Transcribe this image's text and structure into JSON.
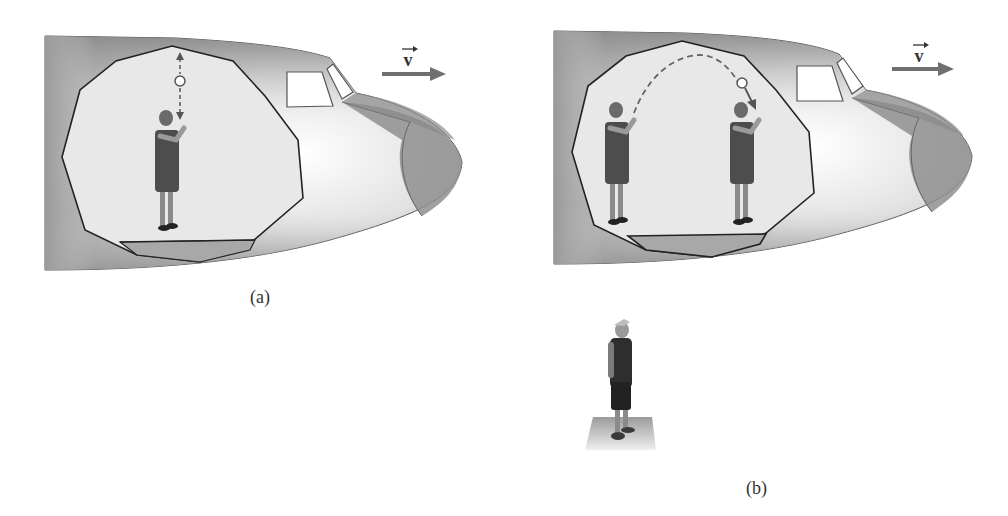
{
  "figure": {
    "panel_a": {
      "caption": "(a)",
      "velocity_label": "v",
      "description": "Airplane moving at constant velocity; person inside tosses ball straight up and it falls straight back"
    },
    "panel_b": {
      "caption": "(b)",
      "velocity_label": "v",
      "description": "Same toss seen by a ground observer; ball follows a parabolic path while person moves forward"
    },
    "observer": {
      "description": "Ground observer standing on a platform looking up"
    },
    "colors": {
      "fuselage_dark": "#8a8a8a",
      "fuselage_light": "#f4f4f4",
      "nose_cone": "#8f8f8f",
      "cutaway_interior": "#e6e6e6",
      "floor": "#a9a9a9",
      "outline": "#222222",
      "arrow": "#707070",
      "person_dress": "#4a4a4a",
      "person_skin": "#9a9a9a"
    }
  }
}
